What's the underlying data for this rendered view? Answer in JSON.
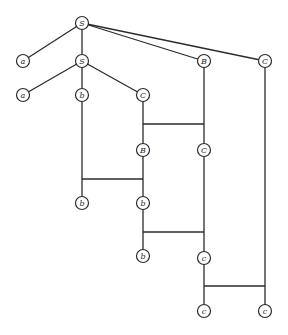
{
  "diagram": {
    "type": "derivation-tree",
    "style": {
      "line_color": "#2b2b2b",
      "node_fill": "#ffffff",
      "node_radius": 6.5
    },
    "nodes": [
      {
        "id": "S_root",
        "label": "S",
        "x": 82,
        "y": 23
      },
      {
        "id": "a1",
        "label": "a",
        "x": 23,
        "y": 61
      },
      {
        "id": "S2",
        "label": "S",
        "x": 82,
        "y": 61
      },
      {
        "id": "B1",
        "label": "B",
        "x": 204,
        "y": 61
      },
      {
        "id": "C1",
        "label": "C",
        "x": 265,
        "y": 61
      },
      {
        "id": "a2",
        "label": "a",
        "x": 23,
        "y": 95
      },
      {
        "id": "b1",
        "label": "b",
        "x": 82,
        "y": 95
      },
      {
        "id": "C2",
        "label": "C",
        "x": 143,
        "y": 95
      },
      {
        "id": "B2",
        "label": "B",
        "x": 143,
        "y": 150
      },
      {
        "id": "C3",
        "label": "C",
        "x": 204,
        "y": 150
      },
      {
        "id": "b2",
        "label": "b",
        "x": 82,
        "y": 203
      },
      {
        "id": "b3",
        "label": "b",
        "x": 143,
        "y": 203
      },
      {
        "id": "b4",
        "label": "b",
        "x": 143,
        "y": 256
      },
      {
        "id": "c1",
        "label": "c",
        "x": 204,
        "y": 258
      },
      {
        "id": "c2",
        "label": "c",
        "x": 204,
        "y": 311
      },
      {
        "id": "c3",
        "label": "c",
        "x": 265,
        "y": 311
      }
    ],
    "edges": [
      {
        "from": "S_root",
        "to": "a1",
        "points": [
          [
            82,
            23
          ],
          [
            23,
            61
          ]
        ]
      },
      {
        "from": "S_root",
        "to": "S2",
        "points": [
          [
            82,
            23
          ],
          [
            82,
            61
          ]
        ]
      },
      {
        "from": "S_root",
        "to": "B1",
        "points": [
          [
            82,
            23
          ],
          [
            204,
            61
          ]
        ]
      },
      {
        "from": "S_root",
        "to": "C1",
        "points": [
          [
            82,
            23
          ],
          [
            265,
            61
          ]
        ]
      },
      {
        "from": "S2",
        "to": "a2",
        "points": [
          [
            82,
            61
          ],
          [
            23,
            95
          ]
        ]
      },
      {
        "from": "S2",
        "to": "b1",
        "points": [
          [
            82,
            61
          ],
          [
            82,
            95
          ]
        ]
      },
      {
        "from": "S2",
        "to": "C2",
        "points": [
          [
            82,
            61
          ],
          [
            143,
            95
          ]
        ]
      },
      {
        "from": "C2",
        "to": "B2",
        "points": [
          [
            143,
            95
          ],
          [
            143,
            150
          ]
        ]
      },
      {
        "from": "B1",
        "to": "C3",
        "points": [
          [
            204,
            61
          ],
          [
            204,
            150
          ]
        ]
      },
      {
        "from": "swap1",
        "to": "",
        "points": [
          [
            143,
            124
          ],
          [
            204,
            124
          ]
        ]
      },
      {
        "from": "b1",
        "to": "b2",
        "points": [
          [
            82,
            95
          ],
          [
            82,
            203
          ]
        ]
      },
      {
        "from": "B2",
        "to": "b3",
        "points": [
          [
            143,
            150
          ],
          [
            143,
            203
          ]
        ]
      },
      {
        "from": "swap2",
        "to": "",
        "points": [
          [
            82,
            179
          ],
          [
            143,
            179
          ]
        ]
      },
      {
        "from": "b3",
        "to": "b4",
        "points": [
          [
            143,
            203
          ],
          [
            143,
            256
          ]
        ]
      },
      {
        "from": "C3",
        "to": "c1",
        "points": [
          [
            204,
            150
          ],
          [
            204,
            258
          ]
        ]
      },
      {
        "from": "swap3",
        "to": "",
        "points": [
          [
            143,
            232
          ],
          [
            204,
            232
          ]
        ]
      },
      {
        "from": "c1",
        "to": "c2",
        "points": [
          [
            204,
            258
          ],
          [
            204,
            311
          ]
        ]
      },
      {
        "from": "C1",
        "to": "c3",
        "points": [
          [
            265,
            61
          ],
          [
            265,
            311
          ]
        ]
      },
      {
        "from": "swap4",
        "to": "",
        "points": [
          [
            204,
            286
          ],
          [
            265,
            286
          ]
        ]
      }
    ]
  }
}
